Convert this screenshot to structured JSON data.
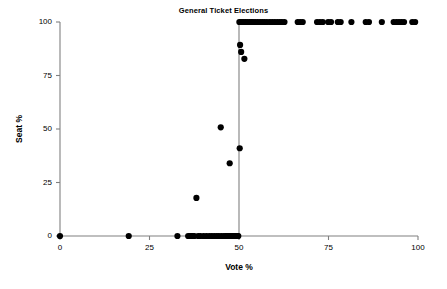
{
  "chart_data": {
    "type": "scatter",
    "title": "General Ticket Elections",
    "xlabel": "Vote %",
    "ylabel": "Seat %",
    "xlim": [
      0,
      100
    ],
    "ylim": [
      0,
      100
    ],
    "xticks": [
      0,
      25,
      50,
      75,
      100
    ],
    "yticks": [
      0,
      25,
      50,
      75,
      100
    ],
    "xtick_labels": [
      "0",
      "25",
      "50",
      "75",
      "100"
    ],
    "ytick_labels": [
      "0",
      "25",
      "50",
      "75",
      "100"
    ],
    "grid": false,
    "legend": null,
    "marker": "filled-circle",
    "marker_color": "#000000",
    "marker_size_px": 3.1,
    "annotations": [
      {
        "kind": "vertical-reference-line",
        "x": 50,
        "color": "#808080",
        "description": "vertical line at Vote % = 50 marking the majority threshold"
      }
    ],
    "points": [
      {
        "x": 0.0,
        "y": 0
      },
      {
        "x": 19.2,
        "y": 0
      },
      {
        "x": 32.8,
        "y": 0
      },
      {
        "x": 35.8,
        "y": 0
      },
      {
        "x": 36.3,
        "y": 0
      },
      {
        "x": 36.7,
        "y": 0
      },
      {
        "x": 37.1,
        "y": 0
      },
      {
        "x": 37.5,
        "y": 0
      },
      {
        "x": 38.6,
        "y": 0
      },
      {
        "x": 39.2,
        "y": 0
      },
      {
        "x": 40.1,
        "y": 0
      },
      {
        "x": 40.9,
        "y": 0
      },
      {
        "x": 41.7,
        "y": 0
      },
      {
        "x": 42.4,
        "y": 0
      },
      {
        "x": 43.1,
        "y": 0
      },
      {
        "x": 43.8,
        "y": 0
      },
      {
        "x": 44.4,
        "y": 0
      },
      {
        "x": 45.1,
        "y": 0
      },
      {
        "x": 45.8,
        "y": 0
      },
      {
        "x": 46.3,
        "y": 0
      },
      {
        "x": 46.7,
        "y": 0
      },
      {
        "x": 47.0,
        "y": 0
      },
      {
        "x": 47.3,
        "y": 0
      },
      {
        "x": 47.6,
        "y": 0
      },
      {
        "x": 47.9,
        "y": 0
      },
      {
        "x": 48.2,
        "y": 0
      },
      {
        "x": 48.4,
        "y": 0
      },
      {
        "x": 48.6,
        "y": 0
      },
      {
        "x": 48.8,
        "y": 0
      },
      {
        "x": 49.0,
        "y": 0
      },
      {
        "x": 49.2,
        "y": 0
      },
      {
        "x": 49.4,
        "y": 0
      },
      {
        "x": 49.6,
        "y": 0
      },
      {
        "x": 49.8,
        "y": 0
      },
      {
        "x": 38.1,
        "y": 17.8
      },
      {
        "x": 47.4,
        "y": 34.0
      },
      {
        "x": 50.2,
        "y": 41.0
      },
      {
        "x": 44.9,
        "y": 50.8
      },
      {
        "x": 51.5,
        "y": 82.8
      },
      {
        "x": 50.6,
        "y": 86.0
      },
      {
        "x": 50.3,
        "y": 89.3
      },
      {
        "x": 50.1,
        "y": 100
      },
      {
        "x": 50.5,
        "y": 100
      },
      {
        "x": 50.9,
        "y": 100
      },
      {
        "x": 51.3,
        "y": 100
      },
      {
        "x": 51.8,
        "y": 100
      },
      {
        "x": 52.3,
        "y": 100
      },
      {
        "x": 52.9,
        "y": 100
      },
      {
        "x": 53.4,
        "y": 100
      },
      {
        "x": 53.9,
        "y": 100
      },
      {
        "x": 54.5,
        "y": 100
      },
      {
        "x": 55.2,
        "y": 100
      },
      {
        "x": 55.9,
        "y": 100
      },
      {
        "x": 56.5,
        "y": 100
      },
      {
        "x": 57.1,
        "y": 100
      },
      {
        "x": 57.8,
        "y": 100
      },
      {
        "x": 58.6,
        "y": 100
      },
      {
        "x": 59.3,
        "y": 100
      },
      {
        "x": 60.0,
        "y": 100
      },
      {
        "x": 60.7,
        "y": 100
      },
      {
        "x": 61.4,
        "y": 100
      },
      {
        "x": 62.0,
        "y": 100
      },
      {
        "x": 62.7,
        "y": 100
      },
      {
        "x": 66.4,
        "y": 100
      },
      {
        "x": 67.1,
        "y": 100
      },
      {
        "x": 67.8,
        "y": 100
      },
      {
        "x": 71.8,
        "y": 100
      },
      {
        "x": 72.6,
        "y": 100
      },
      {
        "x": 73.4,
        "y": 100
      },
      {
        "x": 74.9,
        "y": 100
      },
      {
        "x": 75.7,
        "y": 100
      },
      {
        "x": 77.6,
        "y": 100
      },
      {
        "x": 78.4,
        "y": 100
      },
      {
        "x": 81.4,
        "y": 100
      },
      {
        "x": 85.4,
        "y": 100
      },
      {
        "x": 86.3,
        "y": 100
      },
      {
        "x": 89.9,
        "y": 100
      },
      {
        "x": 93.2,
        "y": 100
      },
      {
        "x": 94.0,
        "y": 100
      },
      {
        "x": 94.7,
        "y": 100
      },
      {
        "x": 95.4,
        "y": 100
      },
      {
        "x": 96.1,
        "y": 100
      },
      {
        "x": 98.4,
        "y": 100
      },
      {
        "x": 99.2,
        "y": 100
      }
    ]
  },
  "geometry": {
    "plot_left": 60,
    "plot_right": 418,
    "plot_top": 22,
    "plot_bottom": 236,
    "tick_len": 4
  },
  "colors": {
    "axis": "#808080",
    "marker": "#000000",
    "text": "#000000",
    "background": "#ffffff"
  }
}
